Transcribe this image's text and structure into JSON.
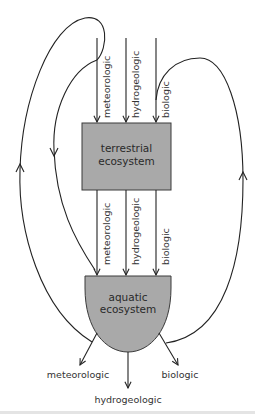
{
  "nodes": {
    "terrestrial": {
      "line1": "terrestrial",
      "line2": "ecosystem"
    },
    "aquatic": {
      "line1": "aquatic",
      "line2": "ecosystem"
    }
  },
  "inputs_to_terrestrial": [
    "meteorologic",
    "hydrogeologic",
    "biologic"
  ],
  "terrestrial_to_aquatic": [
    "meteorologic",
    "hydrogeologic",
    "biologic"
  ],
  "outputs_from_aquatic": [
    "meteorologic",
    "hydrogeologic",
    "biologic"
  ],
  "colors": {
    "node_fill": "#a9a9a9",
    "node_stroke": "#3a3a3a",
    "line": "#222222"
  }
}
